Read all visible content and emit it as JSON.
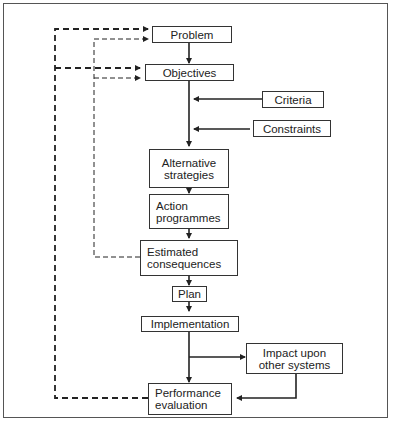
{
  "diagram": {
    "type": "flowchart",
    "nodes": [
      {
        "id": "problem",
        "label": "Problem"
      },
      {
        "id": "objectives",
        "label": "Objectives"
      },
      {
        "id": "criteria",
        "label": "Criteria"
      },
      {
        "id": "constraints",
        "label": "Constraints"
      },
      {
        "id": "alternative_strategies",
        "label": "Alternative\nstrategies"
      },
      {
        "id": "action_programmes",
        "label": "Action\nprogrammes"
      },
      {
        "id": "estimated_consequences",
        "label": "Estimated\nconsequences"
      },
      {
        "id": "plan",
        "label": "Plan"
      },
      {
        "id": "implementation",
        "label": "Implementation"
      },
      {
        "id": "impact",
        "label": "Impact upon\nother systems"
      },
      {
        "id": "performance_evaluation",
        "label": "Performance\nevaluation"
      }
    ],
    "edges": [
      {
        "from": "problem",
        "to": "objectives",
        "style": "solid"
      },
      {
        "from": "criteria",
        "to": "objectives-line",
        "style": "solid"
      },
      {
        "from": "constraints",
        "to": "objectives-line",
        "style": "solid"
      },
      {
        "from": "objectives",
        "to": "alternative_strategies",
        "style": "solid"
      },
      {
        "from": "alternative_strategies",
        "to": "action_programmes",
        "style": "solid"
      },
      {
        "from": "action_programmes",
        "to": "estimated_consequences",
        "style": "solid"
      },
      {
        "from": "estimated_consequences",
        "to": "plan",
        "style": "solid"
      },
      {
        "from": "plan",
        "to": "implementation",
        "style": "solid"
      },
      {
        "from": "implementation",
        "to": "performance_evaluation",
        "style": "solid"
      },
      {
        "from": "implementation",
        "to": "impact",
        "style": "solid"
      },
      {
        "from": "impact",
        "to": "performance_evaluation",
        "style": "solid"
      },
      {
        "from": "estimated_consequences",
        "to": "problem",
        "style": "thin-dashed"
      },
      {
        "from": "estimated_consequences",
        "to": "objectives",
        "style": "thin-dashed"
      },
      {
        "from": "performance_evaluation",
        "to": "problem",
        "style": "thick-dashed"
      },
      {
        "from": "performance_evaluation",
        "to": "objectives",
        "style": "thick-dashed"
      }
    ]
  },
  "colors": {
    "line": "#222222",
    "box_border": "#333333",
    "frame": "#555555"
  }
}
